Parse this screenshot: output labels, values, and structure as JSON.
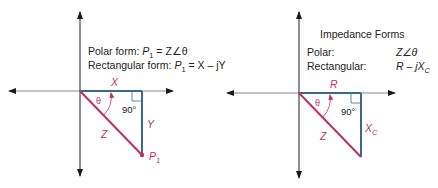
{
  "left_diagram": {
    "polar_line": {
      "prefix": "Polar form: ",
      "lhs": "P",
      "lhs_sub": "1",
      "eq": " = Z∠θ"
    },
    "rect_line": {
      "prefix": "Rectangular form: ",
      "lhs": "P",
      "lhs_sub": "1",
      "eq": " = X – jY"
    },
    "labels": {
      "x": "X",
      "y": "Y",
      "z": "Z",
      "theta": "θ",
      "right_angle": "90°",
      "point": "P",
      "point_sub": "1"
    }
  },
  "right_diagram": {
    "title": "Impedance Forms",
    "rows": [
      {
        "label": "Polar:",
        "value": "Z∠θ"
      },
      {
        "label": "Rectangular:",
        "value": "R – jX",
        "value_sub": "C"
      }
    ],
    "labels": {
      "r": "R",
      "xc": "X",
      "xc_sub": "C",
      "z": "Z",
      "theta": "θ",
      "right_angle": "90°"
    }
  },
  "colors": {
    "axis": "#1a1a1a",
    "leg": "#3a6a8a",
    "hyp": "#c2315e",
    "text": "#222222"
  }
}
